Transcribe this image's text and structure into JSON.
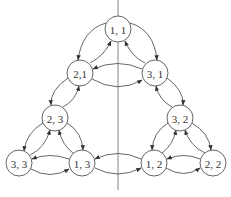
{
  "diagram": {
    "type": "state-transition-graph",
    "divider": {
      "x": 118,
      "y1": 0,
      "y2": 190
    },
    "node_radius": 13,
    "nodes": [
      {
        "id": "n11",
        "label": "1, 1",
        "x": 118,
        "y": 29
      },
      {
        "id": "n21",
        "label": "2,1",
        "x": 80,
        "y": 73
      },
      {
        "id": "n31",
        "label": "3, 1",
        "x": 155,
        "y": 73
      },
      {
        "id": "n23",
        "label": "2, 3",
        "x": 55,
        "y": 118
      },
      {
        "id": "n32",
        "label": "3, 2",
        "x": 180,
        "y": 118
      },
      {
        "id": "n33",
        "label": "3, 3",
        "x": 19,
        "y": 163
      },
      {
        "id": "n13",
        "label": "1, 3",
        "x": 82,
        "y": 163
      },
      {
        "id": "n12",
        "label": "1, 2",
        "x": 154,
        "y": 163
      },
      {
        "id": "n22",
        "label": "2, 2",
        "x": 213,
        "y": 163
      }
    ],
    "edges": [
      {
        "from": "n11",
        "to": "n21",
        "path": "M106,23 Q82,30 78,60"
      },
      {
        "from": "n21",
        "to": "n11",
        "path": "M90,63 Q104,56 111,41"
      },
      {
        "from": "n11",
        "to": "n31",
        "path": "M130,23 Q154,30 157,60"
      },
      {
        "from": "n31",
        "to": "n11",
        "path": "M145,63 Q131,56 125,41"
      },
      {
        "from": "n31",
        "to": "n21",
        "path": "M142,69 Q118,58 93,69"
      },
      {
        "from": "n21",
        "to": "n31",
        "path": "M92,79 Q118,94 142,80"
      },
      {
        "from": "n21",
        "to": "n23",
        "path": "M68,78 Q50,90 51,105"
      },
      {
        "from": "n23",
        "to": "n21",
        "path": "M63,107 Q76,100 79,86"
      },
      {
        "from": "n31",
        "to": "n32",
        "path": "M167,78 Q184,90 183,105"
      },
      {
        "from": "n32",
        "to": "n31",
        "path": "M172,107 Q159,100 156,86"
      },
      {
        "from": "n23",
        "to": "n33",
        "path": "M43,123 Q26,133 24,151"
      },
      {
        "from": "n33",
        "to": "n23",
        "path": "M30,155 Q45,148 50,130"
      },
      {
        "from": "n23",
        "to": "n13",
        "path": "M67,123 Q82,132 83,150"
      },
      {
        "from": "n13",
        "to": "n23",
        "path": "M73,153 Q62,145 59,130"
      },
      {
        "from": "n13",
        "to": "n33",
        "path": "M69,159 Q50,152 32,159"
      },
      {
        "from": "n33",
        "to": "n13",
        "path": "M31,169 Q50,180 69,169"
      },
      {
        "from": "n12",
        "to": "n13",
        "path": "M141,159 Q118,148 95,159"
      },
      {
        "from": "n13",
        "to": "n12",
        "path": "M95,168 Q118,180 141,168"
      },
      {
        "from": "n32",
        "to": "n12",
        "path": "M168,123 Q153,132 152,150"
      },
      {
        "from": "n12",
        "to": "n32",
        "path": "M162,153 Q173,145 176,130"
      },
      {
        "from": "n32",
        "to": "n22",
        "path": "M192,123 Q209,133 211,150"
      },
      {
        "from": "n22",
        "to": "n32",
        "path": "M205,153 Q190,146 185,130"
      },
      {
        "from": "n22",
        "to": "n12",
        "path": "M200,159 Q184,152 167,159"
      },
      {
        "from": "n12",
        "to": "n22",
        "path": "M166,168 Q184,179 200,168"
      }
    ]
  }
}
